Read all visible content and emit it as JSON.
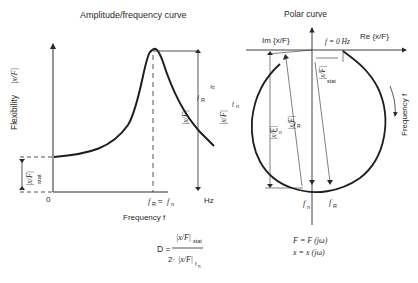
{
  "left_chart": {
    "title": "Amplitude/frequency curve",
    "ylabel": "Flexibility |x/F|",
    "ylabel_text": "Flexibility",
    "ylabel_symbol": "|x/F|",
    "xlabel": "Frequency f",
    "origin_label": "0",
    "unit_label": "Hz",
    "resonance_tick_label": "f_R ≈ f_n",
    "peak_annotation": "|x/F|_fR ≈ |x/F|_fn",
    "static_annotation": "|x/F|_stat"
  },
  "right_chart": {
    "title": "Polar curve",
    "imag_axis_label": "Im {x/F}",
    "real_axis_label": "Re {x/F}",
    "zero_freq_label": "f = 0 Hz",
    "frequency_direction_label": "Frequency f",
    "static_annotation": "|x/F|_stat",
    "fn_annotation": "|x/F|_fn",
    "fR_annotation": "|x/F|_fR",
    "fn_point_label": "f_n",
    "fR_point_label": "f_R"
  },
  "formula": {
    "lhs": "D =",
    "numerator": "|x/F|_stat",
    "denominator": "2 · |x/F|_fn"
  },
  "definitions": [
    "F = F (jω)",
    "x = x (jω)"
  ],
  "colors": {
    "line": "#2a2a2a",
    "background": "#ffffff"
  }
}
